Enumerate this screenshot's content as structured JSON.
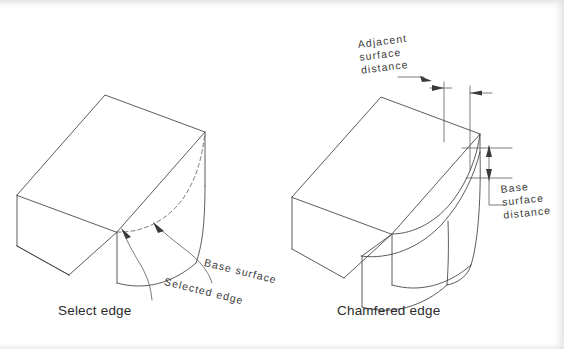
{
  "figure": {
    "background_color": "#ffffff",
    "line_color": "#4a4a4a",
    "panels": [
      {
        "id": "left",
        "caption": "Select edge",
        "annotations": [
          {
            "id": "base-surface",
            "text": "Base  surface"
          },
          {
            "id": "selected-edge",
            "text": "Selected  edge"
          }
        ]
      },
      {
        "id": "right",
        "caption": "Chamfered edge",
        "annotations": [
          {
            "id": "adjacent-surface-distance",
            "lines": [
              "Adjacent",
              "surface",
              "distance"
            ]
          },
          {
            "id": "base-surface-distance",
            "lines": [
              "Base",
              "surface",
              "distance"
            ]
          }
        ]
      }
    ]
  },
  "left_panel": {
    "caption": "Select edge",
    "label_base_surface": "Base  surface",
    "label_selected_edge": "Selected  edge"
  },
  "right_panel": {
    "caption": "Chamfered edge",
    "adj_line1": "Adjacent",
    "adj_line2": "surface",
    "adj_line3": "distance",
    "base_line1": "Base",
    "base_line2": "surface",
    "base_line3": "distance"
  }
}
